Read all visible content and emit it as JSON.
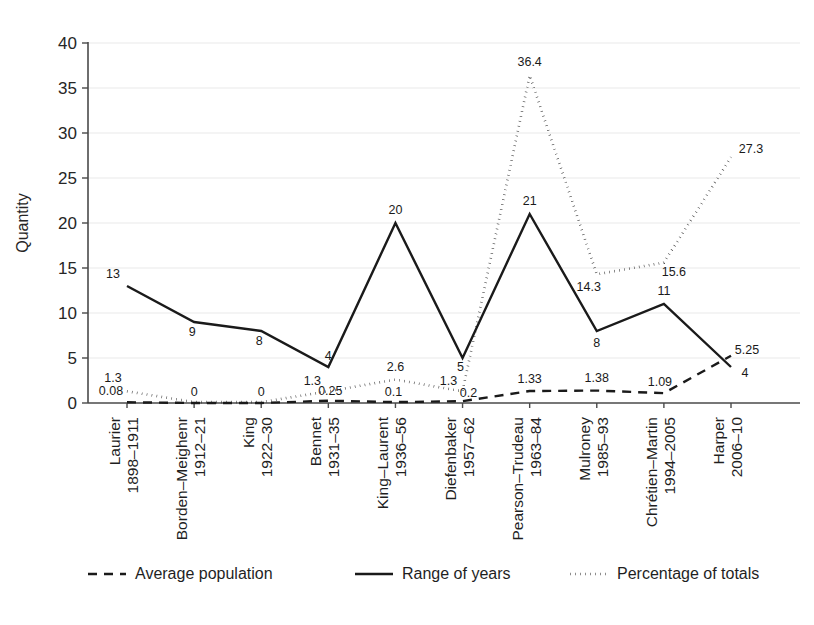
{
  "chart_data": {
    "type": "line",
    "title": "",
    "xlabel": "",
    "ylabel": "Quantity",
    "ylim": [
      0,
      40
    ],
    "yticks": [
      0,
      5,
      10,
      15,
      20,
      25,
      30,
      35,
      40
    ],
    "grid": true,
    "legend_position": "bottom",
    "categories": [
      "Laurier\n1898–1911",
      "Borden–Meighenr\n1912–21",
      "King\n1922–30",
      "Bennet\n1931–35",
      "King–Laurent\n1936–56",
      "Diefenbaker\n1957–62",
      "Pearson–Trudeau\n1963–84",
      "Mulroney\n1985–93",
      "Chrétien–Martin\n1994–2005",
      "Harper\n2006–10"
    ],
    "category_names": [
      "Laurier",
      "Borden–Meighenr",
      "King",
      "Bennet",
      "King–Laurent",
      "Diefenbaker",
      "Pearson–Trudeau",
      "Mulroney",
      "Chrétien–Martin",
      "Harper"
    ],
    "category_years": [
      "1898–1911",
      "1912–21",
      "1922–30",
      "1931–35",
      "1936–56",
      "1957–62",
      "1963–84",
      "1985–93",
      "1994–2005",
      "2006–10"
    ],
    "series": [
      {
        "name": "Average population",
        "style": "dashed",
        "values": [
          0.08,
          0,
          0,
          0.25,
          0.1,
          0.2,
          1.33,
          1.38,
          1.09,
          5.25
        ],
        "labels": [
          "0.08",
          "0",
          "0",
          "0.25",
          "0.1",
          "0.2",
          "1.33",
          "1.38",
          "1.09",
          "5.25"
        ]
      },
      {
        "name": "Range of years",
        "style": "solid",
        "values": [
          13,
          9,
          8,
          4,
          20,
          5,
          21,
          8,
          11,
          4
        ],
        "labels": [
          "13",
          "9",
          "8",
          "4",
          "20",
          "5",
          "21",
          "8",
          "11",
          "4"
        ]
      },
      {
        "name": "Percentage of totals",
        "style": "dotted",
        "values": [
          1.3,
          0.1,
          0.1,
          1.3,
          2.6,
          1.3,
          36.4,
          14.3,
          15.6,
          27.3
        ],
        "labels": [
          "1.3",
          "",
          "",
          "1.3",
          "2.6",
          "1.3",
          "36.4",
          "14.3",
          "15.6",
          "27.3"
        ]
      }
    ]
  },
  "legend": {
    "items": [
      {
        "label": "Average population",
        "style": "dashed"
      },
      {
        "label": "Range of years",
        "style": "solid"
      },
      {
        "label": "Percentage of totals",
        "style": "dotted"
      }
    ]
  },
  "colors": {
    "line": "#1a1a1a",
    "grid": "#e9e9e9",
    "axis": "#4a4a4a",
    "background": "#ffffff"
  }
}
